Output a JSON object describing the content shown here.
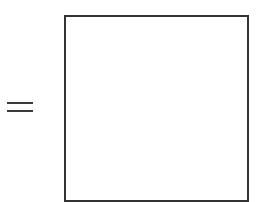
{
  "equation": {
    "operator": "=",
    "operator_icon": "equals-icon",
    "answer": {
      "value": "",
      "border_color": "#333333",
      "background": "#ffffff"
    }
  }
}
